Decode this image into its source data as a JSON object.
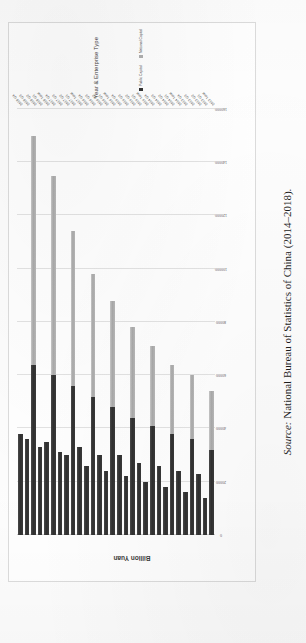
{
  "figure": {
    "orientation": "page-rotated-90ccw",
    "source_caption_label": "Source:",
    "source_caption_text": " National Bureau of Statistics of China (2014–2018)."
  },
  "legend": {
    "position": "right",
    "items": [
      {
        "label": "Public Capital",
        "color": "#333333",
        "swatch": "public"
      },
      {
        "label": "National Capital",
        "color": "#b0b0b0",
        "swatch": "national"
      }
    ]
  },
  "chart_data": {
    "type": "bar",
    "subtype": "stacked-horizontal",
    "title": "",
    "xlabel": "Year & Enterprise Type",
    "ylabel": "Billion Yuan",
    "grid": true,
    "ylim": [
      0,
      160000
    ],
    "ticks": [
      "0",
      "20000",
      "40000",
      "60000",
      "80000",
      "100000",
      "120000",
      "140000",
      "160000"
    ],
    "categories": [
      "2018 Q4",
      "2018 Q3",
      "2018 Q2",
      "2018 Q1",
      "2018 Total",
      "2017 Q4",
      "2017 Q3",
      "2017 Q2",
      "2017 Q1",
      "2017 Total",
      "2016 Q4",
      "2016 Q3",
      "2016 Q2",
      "2016 Q1",
      "2016 Total",
      "2015 Q4",
      "2015 Q3",
      "2015 Q2",
      "2015 Q1",
      "2015 Total",
      "2014 Q4",
      "2014 Q3",
      "2014 Q2",
      "2014 Q1",
      "2014 Total",
      "2013 Q4",
      "2013 Q3",
      "2013 Q2",
      "2013 Q1",
      "2013 Total"
    ],
    "series": [
      {
        "name": "Public Capital",
        "color": "#333333",
        "values": [
          38000,
          36000,
          64000,
          33000,
          35000,
          60000,
          31000,
          30000,
          56000,
          33000,
          26000,
          52000,
          30000,
          24000,
          48000,
          30000,
          22000,
          44000,
          27000,
          20000,
          41000,
          26000,
          18000,
          38000,
          24000,
          16000,
          36000,
          23000,
          14000,
          32000
        ]
      },
      {
        "name": "National Capital",
        "color": "#b0b0b0",
        "values": [
          0,
          0,
          86000,
          0,
          0,
          75000,
          0,
          0,
          58000,
          0,
          0,
          46000,
          0,
          0,
          40000,
          0,
          0,
          34000,
          0,
          0,
          30000,
          0,
          0,
          26000,
          0,
          0,
          24000,
          0,
          0,
          22000
        ]
      }
    ]
  }
}
